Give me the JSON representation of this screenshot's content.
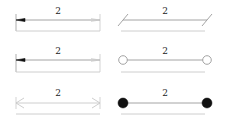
{
  "diagram": {
    "title": "",
    "line_color": "#9a9a9a",
    "dark_color": "#111111",
    "light_color": "#c8c8c8",
    "dimensions": [
      {
        "id": "closed-filled-arrow",
        "label": "2",
        "start_terminator": "filled-arrow",
        "end_terminator": "open-thin-arrow",
        "column": "left",
        "row": 1
      },
      {
        "id": "oblique-tick",
        "label": "2",
        "start_terminator": "oblique-slash",
        "end_terminator": "oblique-slash",
        "column": "right",
        "row": 1
      },
      {
        "id": "filled-arrow-alt",
        "label": "2",
        "start_terminator": "filled-arrow",
        "end_terminator": "open-thin-arrow",
        "column": "left",
        "row": 2
      },
      {
        "id": "open-circle",
        "label": "2",
        "start_terminator": "open-circle",
        "end_terminator": "open-circle",
        "column": "right",
        "row": 2
      },
      {
        "id": "open-arrow",
        "label": "2",
        "start_terminator": "open-arrow",
        "end_terminator": "open-arrow",
        "column": "left",
        "row": 3
      },
      {
        "id": "filled-dot",
        "label": "2",
        "start_terminator": "filled-dot",
        "end_terminator": "filled-dot",
        "column": "right",
        "row": 3
      }
    ]
  }
}
